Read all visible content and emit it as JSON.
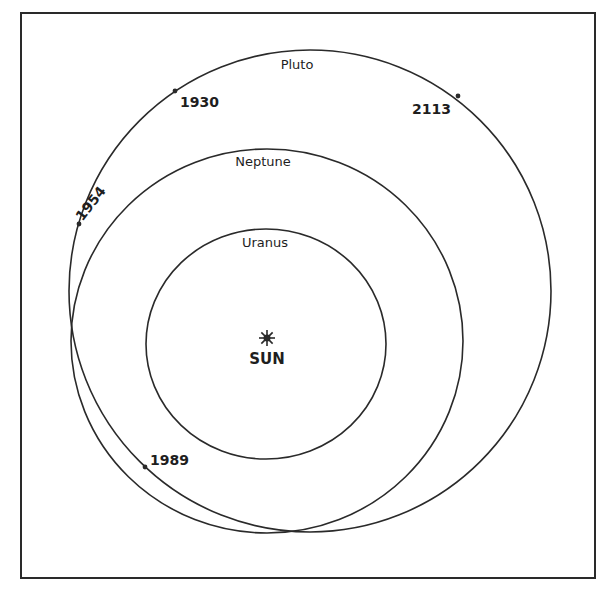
{
  "diagram": {
    "colors": {
      "stroke": "#2a2a2a",
      "background": "#ffffff",
      "text": "#1e1e1e"
    },
    "frame": {
      "x": 21,
      "y": 13,
      "width": 574,
      "height": 565
    },
    "sun": {
      "label": "SUN",
      "x": 267,
      "y": 338
    },
    "orbits": [
      {
        "name": "Uranus",
        "label": "Uranus",
        "cx": 266,
        "cy": 344,
        "rx": 120,
        "ry": 115,
        "label_x": 265,
        "label_y": 236
      },
      {
        "name": "Neptune",
        "label": "Neptune",
        "cx": 267,
        "cy": 341,
        "rx": 196,
        "ry": 192,
        "label_x": 263,
        "label_y": 155
      },
      {
        "name": "Pluto",
        "label": "Pluto",
        "cx": 310,
        "cy": 291,
        "rx": 241,
        "ry": 241,
        "label_x": 297,
        "label_y": 58
      }
    ],
    "pluto_positions": [
      {
        "year": "1930",
        "dot_x": 175,
        "dot_y": 91,
        "label_x": 180,
        "label_y": 95,
        "rotate": 0
      },
      {
        "year": "2113",
        "dot_x": 458,
        "dot_y": 96,
        "label_x": 412,
        "label_y": 102,
        "rotate": 0
      },
      {
        "year": "1954",
        "dot_x": 79,
        "dot_y": 224,
        "label_x": 84,
        "label_y": 209,
        "rotate": -52
      },
      {
        "year": "1989",
        "dot_x": 145,
        "dot_y": 467,
        "label_x": 150,
        "label_y": 453,
        "rotate": 0
      }
    ]
  }
}
